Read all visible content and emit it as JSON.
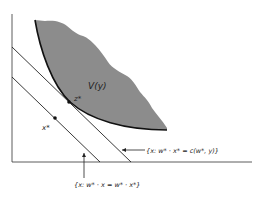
{
  "diagram": {
    "region_label": "V(y)",
    "point_z": "z*",
    "point_x": "x*",
    "upper_line_label": "{x: w* · x* = c(w*, y)}",
    "lower_line_label": "{x: w* · x = w* · x*}",
    "colors": {
      "region_fill": "#8c8c8c",
      "line": "#222222",
      "boundary": "#111111"
    }
  }
}
